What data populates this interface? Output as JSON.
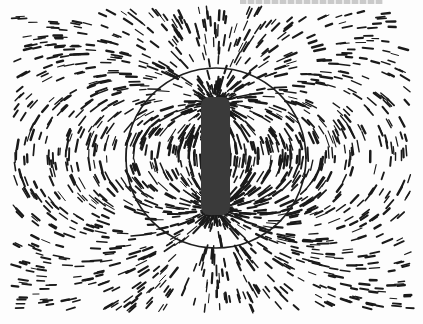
{
  "image": {
    "subject": "Iron filings aligned along magnetic field lines around a bar magnet",
    "background_color": "#fdfdfd",
    "filing_color": "#1a1a1a",
    "magnet_color": "#3a3a3a",
    "circle_color": "#1e1e1e",
    "circle": {
      "cx": 216,
      "cy": 158,
      "r": 90
    },
    "magnet": {
      "x": 201,
      "y": 97,
      "width": 29,
      "height": 118
    },
    "top_fragment_text": ""
  }
}
